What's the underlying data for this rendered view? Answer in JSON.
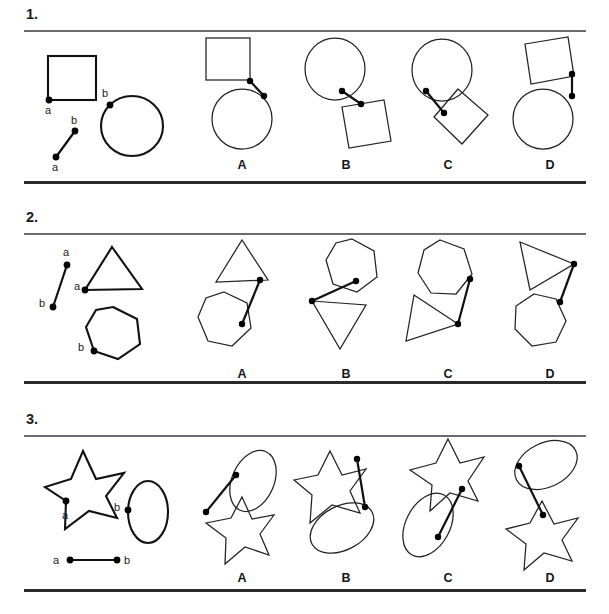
{
  "page": {
    "background": "#ffffff",
    "ink": "#111111"
  },
  "problems": [
    {
      "number": "1.",
      "stimulus": {
        "shapes": [
          "square",
          "circle"
        ],
        "point_labels": [
          "a",
          "b",
          "b",
          "a"
        ],
        "connector_labels": [
          "b",
          "a"
        ],
        "square_point": "a",
        "circle_point": "b"
      },
      "options": [
        {
          "label": "A",
          "shapes": [
            "square",
            "circle"
          ],
          "description": "square upper-left, circle lower-right, short diagonal connector"
        },
        {
          "label": "B",
          "shapes": [
            "circle",
            "square"
          ],
          "description": "circle upper-left, tilted square lower-right, diagonal connector"
        },
        {
          "label": "C",
          "shapes": [
            "circle",
            "square"
          ],
          "description": "circle upper-left, diamond-rotated square lower-right, short connector"
        },
        {
          "label": "D",
          "shapes": [
            "square",
            "circle"
          ],
          "description": "tilted square upper, circle lower, vertical connector"
        }
      ]
    },
    {
      "number": "2.",
      "stimulus": {
        "shapes": [
          "triangle",
          "heptagon"
        ],
        "point_labels": [
          "a",
          "b",
          "a",
          "b"
        ],
        "connector_labels": [
          "a",
          "b"
        ],
        "triangle_point": "a",
        "heptagon_point": "b"
      },
      "options": [
        {
          "label": "A",
          "shapes": [
            "triangle",
            "heptagon"
          ],
          "description": "triangle upper-right, heptagon lower-left, long diagonal connector"
        },
        {
          "label": "B",
          "shapes": [
            "heptagon",
            "triangle"
          ],
          "description": "heptagon upper-right, inverted triangle lower-left, diagonal connector"
        },
        {
          "label": "C",
          "shapes": [
            "heptagon",
            "triangle"
          ],
          "description": "heptagon upper-right, left-pointing triangle lower-left, connector"
        },
        {
          "label": "D",
          "shapes": [
            "triangle",
            "heptagon"
          ],
          "description": "right-pointing triangle upper, heptagon lower, connector"
        }
      ]
    },
    {
      "number": "3.",
      "stimulus": {
        "shapes": [
          "star",
          "ellipse"
        ],
        "point_labels": [
          "a",
          "b",
          "a",
          "b"
        ],
        "connector_labels": [
          "a",
          "b"
        ],
        "star_point": "a",
        "ellipse_point": "b"
      },
      "options": [
        {
          "label": "A",
          "shapes": [
            "ellipse",
            "star"
          ],
          "description": "tilted ellipse upper-right, star lower-left, diagonal connector"
        },
        {
          "label": "B",
          "shapes": [
            "star",
            "ellipse"
          ],
          "description": "star upper-left, tilted ellipse lower, connector"
        },
        {
          "label": "C",
          "shapes": [
            "star",
            "ellipse"
          ],
          "description": "star upper-right, tilted ellipse lower-left, connector"
        },
        {
          "label": "D",
          "shapes": [
            "ellipse",
            "star"
          ],
          "description": "tilted ellipse upper, star lower, long connector"
        }
      ]
    }
  ]
}
